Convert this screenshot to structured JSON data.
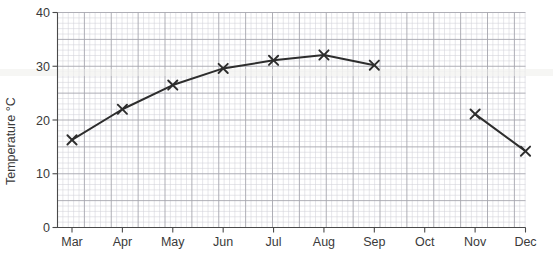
{
  "chart_data": {
    "type": "line",
    "title": "",
    "subtitle": "",
    "xlabel": "",
    "ylabel": "Temperature °C",
    "categories": [
      "Mar",
      "Apr",
      "May",
      "Jun",
      "Jul",
      "Aug",
      "Sep",
      "Oct",
      "Nov",
      "Dec"
    ],
    "x_tick_labels": [
      "Mar",
      "Apr",
      "May",
      "Jun",
      "Jul",
      "Aug",
      "Sep",
      "Oct",
      "Nov",
      "Dec"
    ],
    "y_tick_labels": [
      "0",
      "10",
      "20",
      "30",
      "40"
    ],
    "y_ticks": [
      0,
      10,
      20,
      30,
      40
    ],
    "ylim": [
      0,
      40
    ],
    "grid": "major-and-minor",
    "legend": "none",
    "marker": "x",
    "series": [
      {
        "name": "Temperature",
        "color": "#2d2d2d",
        "points": [
          {
            "x": "Mar",
            "y": 16.3
          },
          {
            "x": "Apr",
            "y": 22.0
          },
          {
            "x": "May",
            "y": 26.5
          },
          {
            "x": "Jun",
            "y": 29.6
          },
          {
            "x": "Jul",
            "y": 31.1
          },
          {
            "x": "Aug",
            "y": 32.1
          },
          {
            "x": "Sep",
            "y": 30.2
          },
          {
            "x": "Oct",
            "y": null
          },
          {
            "x": "Nov",
            "y": 21.1
          },
          {
            "x": "Dec",
            "y": 14.2
          }
        ]
      }
    ],
    "annotations": []
  },
  "axes": {
    "y_axis_title": "Temperature °C",
    "y_labels": [
      "40",
      "30",
      "20",
      "10",
      "0"
    ],
    "x_labels": [
      "Mar",
      "Apr",
      "May",
      "Jun",
      "Jul",
      "Aug",
      "Sep",
      "Oct",
      "Nov",
      "Dec"
    ]
  },
  "colors": {
    "line": "#2d2d2d",
    "grid_minor": "#d2d2d8",
    "grid_major": "#a6a6ae",
    "axis": "#4a4a4a",
    "text": "#3a3a3a",
    "background": "#ffffff"
  }
}
